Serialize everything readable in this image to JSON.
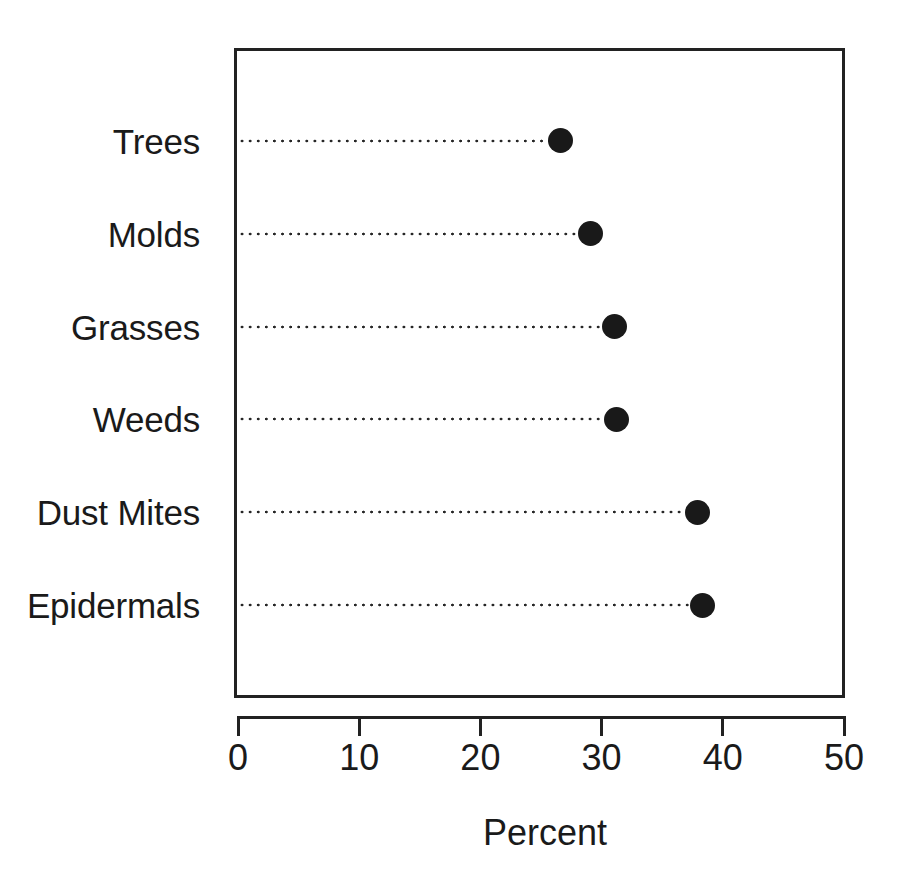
{
  "chart_data": {
    "type": "scatter",
    "subtype": "cleveland-dot-plot",
    "title": "",
    "subtitle": "",
    "xlabel": "Percent",
    "ylabel": "",
    "categories": [
      "Trees",
      "Molds",
      "Grasses",
      "Weeds",
      "Dust Mites",
      "Epidermals"
    ],
    "values": [
      26.6,
      29.1,
      31.1,
      31.2,
      37.9,
      38.3
    ],
    "series": [
      {
        "name": "Percent",
        "values": [
          26.6,
          29.1,
          31.1,
          31.2,
          37.9,
          38.3
        ]
      }
    ],
    "points": [
      {
        "category": "Trees",
        "value": 26.6
      },
      {
        "category": "Molds",
        "value": 29.1
      },
      {
        "category": "Grasses",
        "value": 31.1
      },
      {
        "category": "Weeds",
        "value": 31.2
      },
      {
        "category": "Dust Mites",
        "value": 37.9
      },
      {
        "category": "Epidermals",
        "value": 38.3
      }
    ],
    "xlim": [
      0,
      50
    ],
    "xticks": [
      0,
      10,
      20,
      30,
      40,
      50
    ],
    "xtick_labels": [
      "0",
      "10",
      "20",
      "30",
      "40",
      "50"
    ],
    "grid": false,
    "legend": null,
    "legend_position": "none",
    "leader_lines": true,
    "marker": "filled-circle",
    "marker_color": "#191919",
    "frame_color": "#222222",
    "background_color": "#ffffff",
    "category_order": "bottom-to-top-ascending"
  },
  "axis": {
    "x_title": "Percent",
    "tick_labels": [
      "0",
      "10",
      "20",
      "30",
      "40",
      "50"
    ]
  },
  "colors": {
    "marker": "#191919",
    "frame": "#222222",
    "text": "#1a1a1a",
    "leader": "#262626",
    "background": "#ffffff"
  }
}
